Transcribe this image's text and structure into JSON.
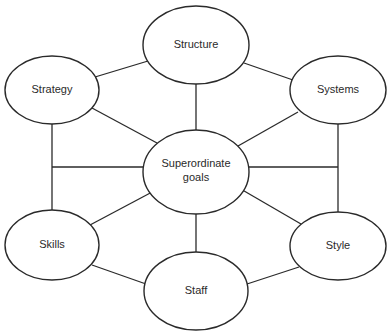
{
  "diagram": {
    "type": "network",
    "title": "",
    "nodes": [
      {
        "id": "structure",
        "label": "Structure"
      },
      {
        "id": "strategy",
        "label": "Strategy"
      },
      {
        "id": "systems",
        "label": "Systems"
      },
      {
        "id": "goals",
        "label": "Superordinate goals",
        "lines": [
          "Superordinate",
          "goals"
        ]
      },
      {
        "id": "skills",
        "label": "Skills"
      },
      {
        "id": "style",
        "label": "Style"
      },
      {
        "id": "staff",
        "label": "Staff"
      }
    ],
    "edges": [
      [
        "structure",
        "strategy"
      ],
      [
        "structure",
        "systems"
      ],
      [
        "structure",
        "goals"
      ],
      [
        "strategy",
        "goals"
      ],
      [
        "strategy",
        "skills"
      ],
      [
        "systems",
        "goals"
      ],
      [
        "systems",
        "style"
      ],
      [
        "goals",
        "skills"
      ],
      [
        "goals",
        "style"
      ],
      [
        "goals",
        "staff"
      ],
      [
        "goals",
        "skills-horizontal"
      ],
      [
        "goals",
        "style-horizontal"
      ],
      [
        "skills",
        "staff"
      ],
      [
        "style",
        "staff"
      ]
    ],
    "colors": {
      "stroke": "#2a2a2a",
      "fill": "#ffffff",
      "text": "#2a2a2a"
    }
  }
}
